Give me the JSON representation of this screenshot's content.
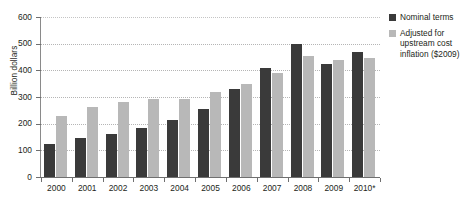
{
  "chart_data": {
    "type": "bar",
    "title": "",
    "xlabel": "",
    "ylabel": "Billion dollars",
    "categories": [
      "2000",
      "2001",
      "2002",
      "2003",
      "2004",
      "2005",
      "2006",
      "2007",
      "2008",
      "2009",
      "2010*"
    ],
    "ylim": [
      0,
      600
    ],
    "yticks": [
      0,
      100,
      200,
      300,
      400,
      500,
      600
    ],
    "ytick_labels": [
      "0",
      "100",
      "200",
      "300",
      "400",
      "500",
      "600"
    ],
    "grid": "horizontal-dotted",
    "legend_position": "right",
    "series": [
      {
        "name": "Nominal terms",
        "color": "#3a3a3a",
        "values": [
          125,
          148,
          160,
          183,
          213,
          255,
          330,
          410,
          500,
          425,
          468
        ]
      },
      {
        "name": "Adjusted for upstream cost inflation ($2009)",
        "color": "#b8b8b8",
        "values": [
          228,
          263,
          283,
          293,
          293,
          318,
          348,
          390,
          455,
          437,
          445
        ]
      }
    ]
  },
  "legend": {
    "entries": [
      {
        "label": "Nominal terms",
        "color": "#3a3a3a"
      },
      {
        "label": "Adjusted for upstream cost inflation ($2009)",
        "color": "#b8b8b8"
      }
    ]
  },
  "axes": {
    "y_title": "Billion dollars"
  }
}
